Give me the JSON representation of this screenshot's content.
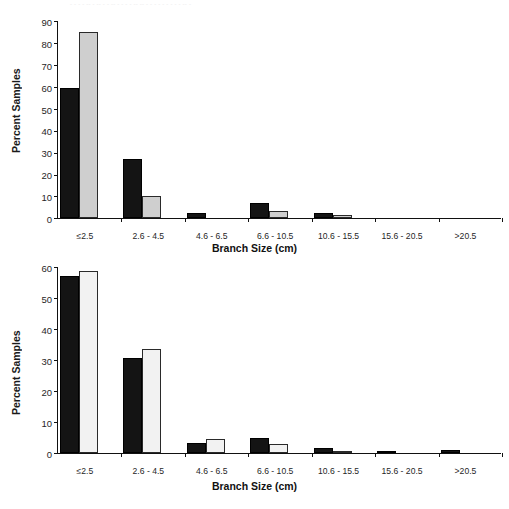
{
  "page": {
    "cut_header_text": "- - - - -- - -- - - -- - - - - -- -- - - - - - - - - - -- -",
    "background": "#ffffff"
  },
  "colors": {
    "series_black": "#141414",
    "series_gray": "#cfcfcf",
    "series_white": "#f2f2f2",
    "axis": "#111111",
    "text": "#262626"
  },
  "chart_data": [
    {
      "id": "chart-top",
      "type": "bar",
      "title": "",
      "xlabel": "Branch Size (cm)",
      "ylabel": "Percent Samples",
      "ylim": [
        0,
        90
      ],
      "ytick_step": 10,
      "yticks": [
        0,
        10,
        20,
        30,
        40,
        50,
        60,
        70,
        80,
        90
      ],
      "grid": false,
      "legend": "none",
      "categories": [
        "≤2.5",
        "2.6 - 4.5",
        "4.6 - 6.5",
        "6.6 - 10.5",
        "10.6 - 15.5",
        "15.6 - 20.5",
        ">20.5"
      ],
      "series": [
        {
          "name": "black",
          "fill": "#141414",
          "values": [
            59.5,
            27.0,
            2.5,
            7.0,
            2.3,
            0.0,
            0.0
          ]
        },
        {
          "name": "gray",
          "fill": "#cfcfcf",
          "values": [
            85.0,
            10.0,
            0.0,
            3.0,
            1.3,
            0.0,
            0.0
          ]
        }
      ]
    },
    {
      "id": "chart-bottom",
      "type": "bar",
      "title": "",
      "xlabel": "Branch Size (cm)",
      "ylabel": "Percent Samples",
      "ylim": [
        0,
        60
      ],
      "ytick_step": 10,
      "yticks": [
        0,
        10,
        20,
        30,
        40,
        50,
        60
      ],
      "grid": false,
      "legend": "none",
      "categories": [
        "≤2.5",
        "2.6 - 4.5",
        "4.6 - 6.5",
        "6.6 - 10.5",
        "10.6 - 15.5",
        "15.6 - 20.5",
        ">20.5"
      ],
      "series": [
        {
          "name": "black",
          "fill": "#141414",
          "values": [
            57.2,
            30.5,
            3.2,
            5.0,
            1.6,
            0.4,
            1.0
          ]
        },
        {
          "name": "white",
          "fill": "#f2f2f2",
          "values": [
            58.6,
            33.5,
            4.6,
            2.8,
            0.2,
            0.0,
            0.0
          ]
        }
      ]
    }
  ]
}
